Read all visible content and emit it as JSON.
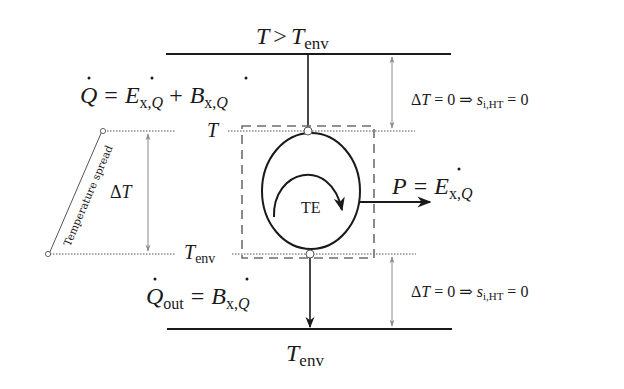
{
  "diagram": {
    "hot_reservoir": {
      "label_main": "T > T",
      "label_sub": "env",
      "full": "T > T_env"
    },
    "cold_reservoir": {
      "label_main": "T",
      "label_sub": "env",
      "full": "T_env"
    },
    "heat_in": {
      "full": "Q̇ = Ė_x,Q + Ḃ_x,Q",
      "q": "Q",
      "eq": "=",
      "e": "E",
      "e_sub": "x,Q",
      "plus": "+",
      "b": "B",
      "b_sub": "x,Q"
    },
    "heat_out": {
      "full": "Q̇_out = Ḃ_x,Q",
      "q": "Q",
      "q_sub": "out",
      "eq": "=",
      "b": "B",
      "b_sub": "x,Q"
    },
    "power_out": {
      "full": "P = Ė_x,Q",
      "p": "P",
      "eq": "=",
      "e": "E",
      "e_sub": "x,Q"
    },
    "engine": {
      "label": "TE"
    },
    "level_labels": {
      "upper": "T",
      "lower_main": "T",
      "lower_sub": "env"
    },
    "spread": {
      "label": "Temperature spread",
      "delta": "ΔT"
    },
    "upper_condition": {
      "full": "ΔT = 0 ⇒ s_i,HT = 0",
      "lhs": "ΔT = 0 ⇒ ",
      "s": "s",
      "s_sub": "i,HT",
      "rhs": " = 0"
    },
    "lower_condition": {
      "full": "ΔT = 0 ⇒ s_i,HT = 0",
      "lhs": "ΔT = 0 ⇒ ",
      "s": "s",
      "s_sub": "i,HT",
      "rhs": " = 0"
    },
    "colors": {
      "ink": "#1a1a1a",
      "gray_arrow": "#8a8a8a",
      "dashed_box": "#6e6e6e",
      "dotted": "#555555"
    }
  }
}
